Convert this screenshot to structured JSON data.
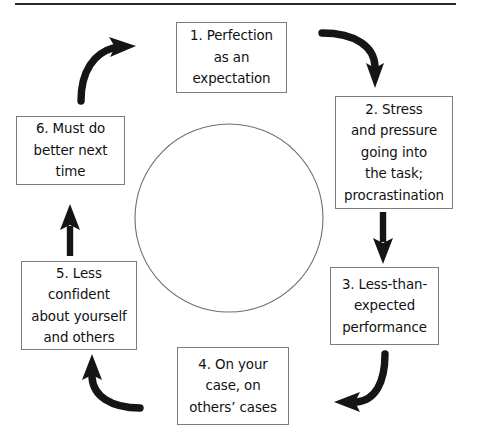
{
  "diagram": {
    "type": "cycle",
    "shape": "circular-flow",
    "colors": {
      "arrow": "#1a1a1a",
      "box_border": "#7c7c7c",
      "circle_stroke": "#6f6f6f",
      "rule": "#2b2b2b",
      "text": "#111111",
      "background": "#ffffff"
    },
    "top_rule": {
      "name": "horizontal-rule",
      "x1": 15,
      "x2": 456,
      "y": 4,
      "thickness": 2
    },
    "center_circle": {
      "name": "center-circle",
      "cx": 229,
      "cy": 218,
      "r": 94
    },
    "nodes": [
      {
        "id": "node-1",
        "number": "1.",
        "label": "1. Perfection\nas an\nexpectation",
        "lines": [
          "1. Perfection",
          "as an",
          "expectation"
        ],
        "position": "top"
      },
      {
        "id": "node-2",
        "number": "2.",
        "label": "2. Stress\nand pressure\ngoing into\nthe task;\nprocrastination",
        "lines": [
          "2. Stress",
          "and pressure",
          "going into",
          "the task;",
          "procrastination"
        ],
        "position": "right-upper"
      },
      {
        "id": "node-3",
        "number": "3.",
        "label": "3. Less-than-\nexpected\nperformance",
        "lines": [
          "3. Less-than-",
          "expected",
          "performance"
        ],
        "position": "right-lower"
      },
      {
        "id": "node-4",
        "number": "4.",
        "label": "4. On your\ncase, on\nothers’ cases",
        "lines": [
          "4. On your",
          "case, on",
          "others’ cases"
        ],
        "position": "bottom"
      },
      {
        "id": "node-5",
        "number": "5.",
        "label": "5. Less\nconfident\nabout yourself\nand others",
        "lines": [
          "5. Less",
          "confident",
          "about yourself",
          "and others"
        ],
        "position": "left-lower"
      },
      {
        "id": "node-6",
        "number": "6.",
        "label": "6. Must do\nbetter next\ntime",
        "lines": [
          "6. Must do",
          "better next",
          "time"
        ],
        "position": "left-upper"
      }
    ],
    "arrows": [
      {
        "name": "arrow-1-to-2",
        "from": "node-1",
        "to": "node-2",
        "style": "curved",
        "direction": "down-right"
      },
      {
        "name": "arrow-2-to-3",
        "from": "node-2",
        "to": "node-3",
        "style": "straight",
        "direction": "down"
      },
      {
        "name": "arrow-3-to-4",
        "from": "node-3",
        "to": "node-4",
        "style": "curved",
        "direction": "down-left"
      },
      {
        "name": "arrow-4-to-5",
        "from": "node-4",
        "to": "node-5",
        "style": "curved",
        "direction": "up-left"
      },
      {
        "name": "arrow-5-to-6",
        "from": "node-5",
        "to": "node-6",
        "style": "straight",
        "direction": "up"
      },
      {
        "name": "arrow-6-to-1",
        "from": "node-6",
        "to": "node-1",
        "style": "curved",
        "direction": "up-right"
      }
    ]
  }
}
